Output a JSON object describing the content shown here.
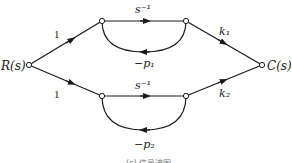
{
  "diagram": {
    "type": "signal-flow-graph",
    "nodes": {
      "input": {
        "label": "R(s)"
      },
      "output": {
        "label": "C(s)"
      }
    },
    "branches": {
      "upper_in_gain": "1",
      "lower_in_gain": "1",
      "upper_forward": "s⁻¹",
      "lower_forward": "s⁻¹",
      "upper_feedback": "−p₁",
      "lower_feedback": "−p₂",
      "upper_out_gain": "k₁",
      "lower_out_gain": "k₂"
    },
    "caption": "(c) 信号流图"
  },
  "colors": {
    "line": "#1a1a1a",
    "text": "#222222",
    "background": "#ffffff"
  }
}
